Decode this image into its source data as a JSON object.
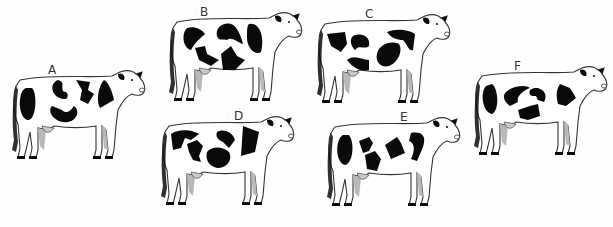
{
  "figure": {
    "background": "#fefefe",
    "outline_color": "#333333",
    "spot_color": "#0a0a0a",
    "leg_shade": "#b8b8b8",
    "cows": [
      {
        "label": "A",
        "x": 8,
        "y": 66,
        "label_dx": 40,
        "label_dy": -2
      },
      {
        "label": "B",
        "x": 165,
        "y": 8,
        "label_dx": 35,
        "label_dy": -2
      },
      {
        "label": "C",
        "x": 313,
        "y": 10,
        "label_dx": 52,
        "label_dy": -2
      },
      {
        "label": "D",
        "x": 157,
        "y": 112,
        "label_dx": 77,
        "label_dy": -2
      },
      {
        "label": "E",
        "x": 323,
        "y": 113,
        "label_dx": 77,
        "label_dy": -2
      },
      {
        "label": "F",
        "x": 470,
        "y": 62,
        "label_dx": 44,
        "label_dy": -2
      }
    ]
  }
}
